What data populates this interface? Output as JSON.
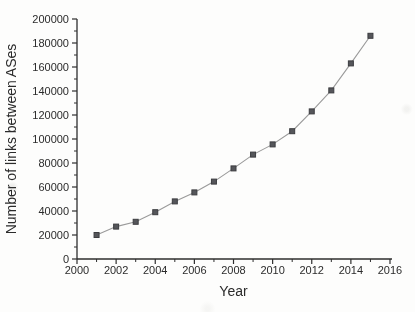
{
  "chart_data": {
    "type": "line",
    "title": "",
    "xlabel": "Year",
    "ylabel": "Number of links between ASes",
    "x": [
      2001,
      2002,
      2003,
      2004,
      2005,
      2006,
      2007,
      2008,
      2009,
      2010,
      2011,
      2012,
      2013,
      2014,
      2015
    ],
    "series": [
      {
        "name": "links-between-ases",
        "values": [
          20000,
          27000,
          31000,
          39000,
          48000,
          55500,
          64500,
          75500,
          87000,
          95500,
          106500,
          123000,
          140500,
          163000,
          186000
        ]
      }
    ],
    "xlim": [
      2000,
      2016
    ],
    "ylim": [
      0,
      200000
    ],
    "x_major_ticks": [
      2000,
      2002,
      2004,
      2006,
      2008,
      2010,
      2012,
      2014,
      2016
    ],
    "x_minor_ticks": [
      2001,
      2003,
      2005,
      2007,
      2009,
      2011,
      2013,
      2015
    ],
    "y_major_ticks": [
      0,
      20000,
      40000,
      60000,
      80000,
      100000,
      120000,
      140000,
      160000,
      180000,
      200000
    ],
    "y_minor_ticks": [
      10000,
      30000,
      50000,
      70000,
      90000,
      110000,
      130000,
      150000,
      170000,
      190000
    ],
    "grid": false,
    "legend": "none",
    "marker": "square",
    "colors": {
      "axis": "#2e2e2e",
      "tick_text": "#2b2b2b",
      "line": "#9a9a9a",
      "marker_fill": "#55565a",
      "marker_stroke": "#3c3d40",
      "background": "#fdfdfc"
    }
  }
}
